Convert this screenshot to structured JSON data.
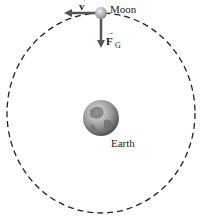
{
  "diagram": {
    "moon_label": "Moon",
    "earth_label": "Earth",
    "velocity_label": "v",
    "force_label": "F",
    "force_subscript": "G",
    "colors": {
      "orbit": "#222222",
      "arrow": "#555555",
      "earth_land": "#7a7a7a",
      "earth_ocean": "#c8c8c8"
    }
  }
}
